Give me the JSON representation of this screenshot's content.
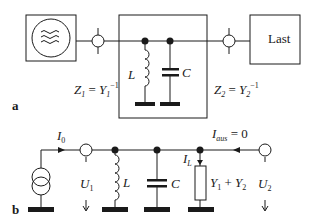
{
  "diagram": {
    "panel_a": {
      "label": "a",
      "source_block": "generator",
      "load_block_label": "Last",
      "inductor_label": "L",
      "capacitor_label": "C",
      "z1_main": "Z",
      "z1_sub": "1",
      "z1_eq": " = ",
      "y1_main": "Y",
      "y1_sub": "1",
      "y1_exp": "−1",
      "z2_main": "Z",
      "z2_sub": "2",
      "z2_eq": " = ",
      "y2_main": "Y",
      "y2_sub": "2",
      "y2_exp": "−1"
    },
    "panel_b": {
      "label": "b",
      "i0_main": "I",
      "i0_sub": "0",
      "u1_main": "U",
      "u1_sub": "1",
      "inductor_label": "L",
      "capacitor_label": "C",
      "il_main": "I",
      "il_sub": "L",
      "load_y_a": "Y",
      "load_y_a_sub": "1",
      "load_plus": " + ",
      "load_y_b": "Y",
      "load_y_b_sub": "2",
      "iaus_main": "I",
      "iaus_sub": "aus",
      "iaus_eq": " = 0",
      "u2_main": "U",
      "u2_sub": "2"
    },
    "colors": {
      "stroke": "#1a1a1a",
      "background": "#ffffff"
    }
  }
}
